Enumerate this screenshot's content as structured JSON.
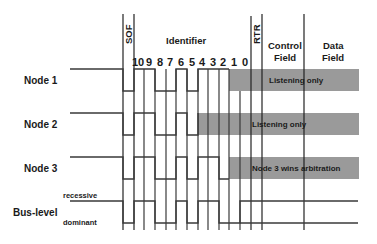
{
  "header": {
    "sof": "SOF",
    "identifier": "Identifier",
    "rtr": "RTR",
    "control_field_line1": "Control",
    "control_field_line2": "Field",
    "data_field_line1": "Data",
    "data_field_line2": "Field",
    "bits": [
      "10",
      "9",
      "8",
      "7",
      "6",
      "5",
      "4",
      "3",
      "2",
      "1",
      "0"
    ]
  },
  "rows": [
    {
      "label": "Node 1",
      "band_text": "Listening only"
    },
    {
      "label": "Node 2",
      "band_text": "Listening only"
    },
    {
      "label": "Node 3",
      "band_text": "Node 3 wins arbitration"
    }
  ],
  "bus": {
    "label": "Bus-level",
    "recessive": "recessive",
    "dominant": "dominant"
  },
  "colors": {
    "band": "#9a9a9a",
    "line": "#3a3a3a",
    "background": "#ffffff"
  }
}
